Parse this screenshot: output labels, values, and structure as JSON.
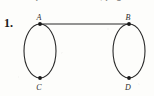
{
  "page": {
    "width": 154,
    "height": 96,
    "background_color": "#fdfdfb",
    "ink_color": "#2a2a2a"
  },
  "header": {
    "cropped_text": "Chapter Exercises, page 560",
    "note": "partially cropped line of text at top edge of scan"
  },
  "problem": {
    "number_label": "1."
  },
  "figure": {
    "type": "graph-diagram",
    "vertices": [
      {
        "id": "A",
        "label": "A",
        "x": 40,
        "y": 24,
        "label_x": 39,
        "label_y": 20
      },
      {
        "id": "B",
        "label": "B",
        "x": 129,
        "y": 24,
        "label_x": 128,
        "label_y": 20
      },
      {
        "id": "C",
        "label": "C",
        "x": 40,
        "y": 78,
        "label_x": 39,
        "label_y": 90
      },
      {
        "id": "D",
        "label": "D",
        "x": 129,
        "y": 78,
        "label_x": 128,
        "label_y": 90
      }
    ],
    "edges": [
      {
        "from": "A",
        "to": "B",
        "shape": "straight"
      },
      {
        "from": "A",
        "to": "C",
        "shape": "arc-left"
      },
      {
        "from": "A",
        "to": "C",
        "shape": "arc-right"
      },
      {
        "from": "B",
        "to": "D",
        "shape": "arc-left"
      },
      {
        "from": "B",
        "to": "D",
        "shape": "arc-right"
      }
    ],
    "ellipses": [
      {
        "name": "left-cycle",
        "cx": 40,
        "cy": 51,
        "rx": 16,
        "ry": 27
      },
      {
        "name": "right-cycle",
        "cx": 129,
        "cy": 51,
        "rx": 16,
        "ry": 27
      }
    ],
    "stroke_width": 1.1,
    "vertex_dot_radius": 1.9
  }
}
